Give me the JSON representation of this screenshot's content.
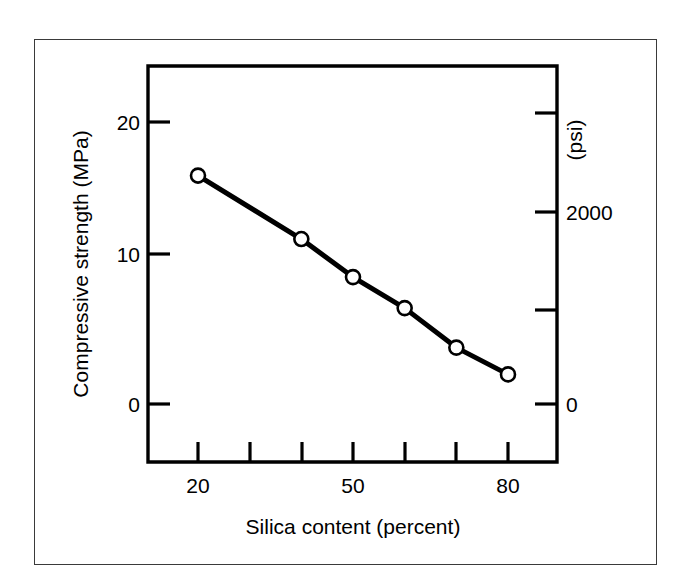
{
  "chart_data": {
    "type": "line",
    "title": "",
    "subtitle": "",
    "xlabel": "Silica content (percent)",
    "ylabel": "Compressive strength (MPa)",
    "y2label": "(psi)",
    "xlim": [
      15,
      85
    ],
    "ylim": [
      -1.5,
      23.5
    ],
    "y2lim": [
      -225,
      3520
    ],
    "grid": false,
    "legend": null,
    "xticks": [
      20,
      30,
      40,
      50,
      60,
      70,
      80
    ],
    "xticklabels": [
      "20",
      "",
      "",
      "50",
      "",
      "",
      "80"
    ],
    "yticks": [
      0,
      10,
      20
    ],
    "yticklabels": [
      "0",
      "10",
      "20"
    ],
    "y2ticks": [
      0,
      1000,
      2000,
      3000
    ],
    "y2ticklabels": [
      "0",
      "",
      "2000",
      ""
    ],
    "marker": "open-circle",
    "line_color": "#000000",
    "x": [
      20,
      40,
      50,
      60,
      70,
      80
    ],
    "values": [
      16.2,
      11.7,
      9.0,
      6.8,
      4.0,
      2.1
    ],
    "series": [
      {
        "name": "Compressive strength",
        "x": [
          20,
          40,
          50,
          60,
          70,
          80
        ],
        "values": [
          16.2,
          11.7,
          9.0,
          6.8,
          4.0,
          2.1
        ]
      }
    ]
  },
  "axes": {
    "x_title": "Silica content (percent)",
    "y_left_title": "Compressive strength (MPa)",
    "y_right_title": "(psi)",
    "x_labels": [
      "20",
      "50",
      "80"
    ],
    "y_left_labels": [
      "20",
      "10",
      "0"
    ],
    "y_right_labels": [
      "2000",
      "0"
    ]
  },
  "colors": {
    "line": "#000000",
    "axis": "#000000",
    "frame": "#3a3a3a",
    "background": "#ffffff",
    "marker_fill": "#ffffff"
  }
}
